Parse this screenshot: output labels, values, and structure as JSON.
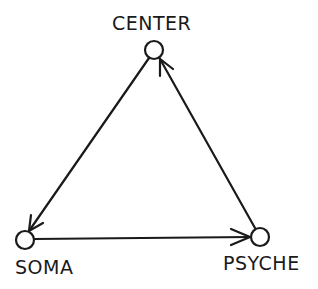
{
  "nodes": [
    {
      "id": "center",
      "label": "CENTER"
    },
    {
      "id": "soma",
      "label": "SOMA"
    },
    {
      "id": "psyche",
      "label": "PSYCHE"
    }
  ],
  "edges": [
    {
      "from": "center",
      "to": "soma"
    },
    {
      "from": "soma",
      "to": "psyche"
    },
    {
      "from": "psyche",
      "to": "center"
    }
  ],
  "colors": {
    "stroke": "#1a1a1a",
    "background": "#ffffff"
  }
}
